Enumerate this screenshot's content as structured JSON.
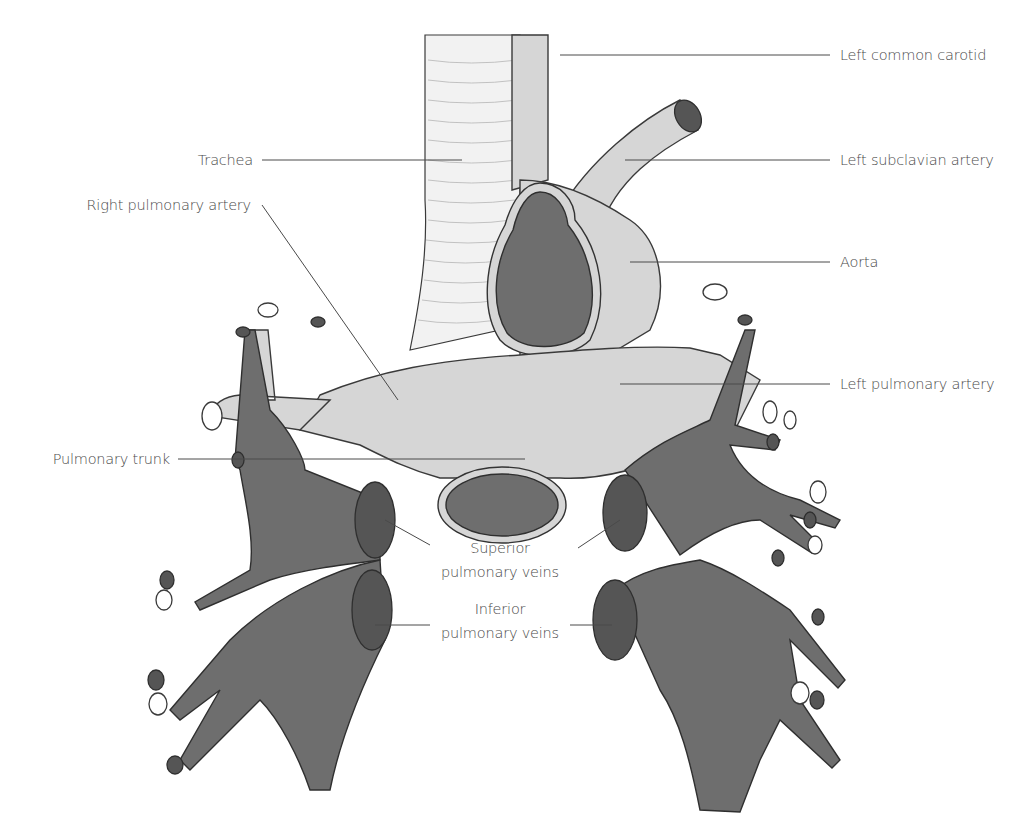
{
  "diagram": {
    "colors": {
      "background": "#ffffff",
      "artery_fill": "#d6d6d6",
      "vein_fill": "#6e6e6e",
      "bronchus_fill": "#f2f2f2",
      "outline": "#3a3a3a",
      "label_text": "#4a4a4a"
    },
    "labels": {
      "left_common_carotid": "Left common carotid",
      "left_subclavian_artery": "Left subclavian artery",
      "trachea": "Trachea",
      "right_pulmonary_artery": "Right pulmonary artery",
      "aorta": "Aorta",
      "left_pulmonary_artery": "Left pulmonary artery",
      "pulmonary_trunk": "Pulmonary trunk",
      "superior_line1": "Superior",
      "superior_line2": "pulmonary veins",
      "inferior_line1": "Inferior",
      "inferior_line2": "pulmonary veins"
    }
  }
}
